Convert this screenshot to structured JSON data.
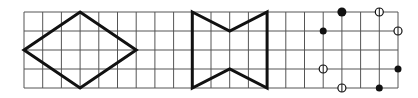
{
  "grid": {
    "origin_x": 24,
    "origin_y": 12,
    "cell_w": 18.7,
    "cell_h": 19,
    "cols": 20,
    "rows": 4,
    "line_color": "#555555"
  },
  "figures": [
    {
      "name": "rhombus",
      "type": "polygon",
      "points": [
        [
          0,
          2
        ],
        [
          3,
          0
        ],
        [
          6,
          2
        ],
        [
          3,
          4
        ]
      ],
      "stroke": "#111111"
    },
    {
      "name": "bowtie-hexagon",
      "type": "polygon",
      "points": [
        [
          9,
          0
        ],
        [
          11,
          1
        ],
        [
          13,
          0
        ],
        [
          13,
          4
        ],
        [
          11,
          3
        ],
        [
          9,
          4
        ]
      ],
      "stroke": "#111111"
    }
  ],
  "dots": {
    "filled": [
      [
        17,
        0
      ],
      [
        16,
        1
      ],
      [
        20,
        3
      ],
      [
        19,
        4
      ]
    ],
    "open": [
      [
        19,
        0
      ],
      [
        20,
        1
      ],
      [
        16,
        3
      ],
      [
        17,
        4
      ]
    ]
  }
}
